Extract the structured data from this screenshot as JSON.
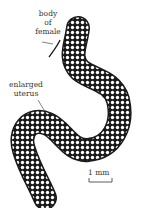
{
  "figure": {
    "labels": {
      "body_of_female": [
        "body",
        "of",
        "female"
      ],
      "enlarged_uterus": [
        "enlarged",
        "uterus"
      ]
    },
    "scale_bar": {
      "label": "1 mm"
    },
    "colors": {
      "ink": "#1a1a1a",
      "egg_fill": "#ffffff",
      "background": "#ffffff"
    }
  }
}
